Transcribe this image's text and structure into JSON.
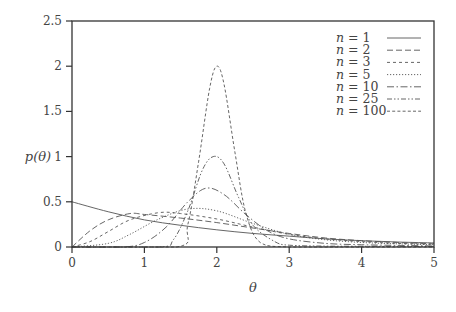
{
  "chart_data": {
    "type": "line",
    "title": "",
    "xlabel": "θ",
    "ylabel": "p(θ)",
    "xlim": [
      0,
      5
    ],
    "ylim": [
      0,
      2.5
    ],
    "x_ticks": [
      "0",
      "1",
      "2",
      "3",
      "4",
      "5"
    ],
    "y_ticks": [
      "0",
      "0.5",
      "1",
      "1.5",
      "2",
      "2.5"
    ],
    "grid": false,
    "legend_position": "upper right",
    "note": "Curve values are approximate visual readings of the plotted densities, not computed from a known formula.",
    "series": [
      {
        "name": "n = 1",
        "style": "solid",
        "peak_theta": 0.0,
        "peak_value": 0.5,
        "x": [
          0,
          0.5,
          1,
          1.5,
          2,
          2.5,
          3,
          3.5,
          4,
          4.5,
          5
        ],
        "y": [
          0.5,
          0.39,
          0.3,
          0.24,
          0.19,
          0.15,
          0.12,
          0.09,
          0.07,
          0.055,
          0.045
        ]
      },
      {
        "name": "n = 2",
        "style": "dashed",
        "peak_theta": 0.8,
        "peak_value": 0.37,
        "x": [
          0,
          0.25,
          0.5,
          0.8,
          1,
          1.5,
          2,
          2.5,
          3,
          3.5,
          4,
          4.5,
          5
        ],
        "y": [
          0,
          0.18,
          0.3,
          0.37,
          0.36,
          0.32,
          0.27,
          0.21,
          0.15,
          0.1,
          0.07,
          0.05,
          0.035
        ]
      },
      {
        "name": "n = 3",
        "style": "short-dashed",
        "peak_theta": 1.2,
        "peak_value": 0.38,
        "x": [
          0,
          0.25,
          0.5,
          0.8,
          1.2,
          1.5,
          2,
          2.5,
          3,
          3.5,
          4,
          4.5,
          5
        ],
        "y": [
          0,
          0.06,
          0.17,
          0.3,
          0.38,
          0.37,
          0.31,
          0.22,
          0.14,
          0.09,
          0.06,
          0.04,
          0.03
        ]
      },
      {
        "name": "n = 5",
        "style": "dotted",
        "peak_theta": 1.6,
        "peak_value": 0.42,
        "x": [
          0,
          0.5,
          0.8,
          1.2,
          1.6,
          2,
          2.5,
          3,
          3.5,
          4,
          4.5,
          5
        ],
        "y": [
          0,
          0.04,
          0.14,
          0.31,
          0.42,
          0.4,
          0.26,
          0.14,
          0.08,
          0.05,
          0.035,
          0.025
        ]
      },
      {
        "name": "n = 10",
        "style": "dash-dot",
        "peak_theta": 1.85,
        "peak_value": 0.65,
        "x": [
          0,
          0.7,
          1,
          1.3,
          1.6,
          1.85,
          2.1,
          2.4,
          2.7,
          3,
          3.5,
          4,
          4.5,
          5
        ],
        "y": [
          0,
          0.0,
          0.05,
          0.22,
          0.5,
          0.65,
          0.58,
          0.36,
          0.18,
          0.09,
          0.04,
          0.025,
          0.018,
          0.012
        ]
      },
      {
        "name": "n = 25",
        "style": "dash-dot-dot",
        "peak_theta": 1.95,
        "peak_value": 1.0,
        "x": [
          0,
          1.2,
          1.4,
          1.6,
          1.8,
          1.95,
          2.1,
          2.3,
          2.5,
          2.8,
          3,
          3.5,
          4,
          5
        ],
        "y": [
          0,
          0.0,
          0.08,
          0.4,
          0.85,
          1.0,
          0.92,
          0.55,
          0.24,
          0.06,
          0.02,
          0.01,
          0.008,
          0.005
        ]
      },
      {
        "name": "n = 100",
        "style": "fine-dashed",
        "peak_theta": 2.0,
        "peak_value": 2.0,
        "x": [
          0,
          1.45,
          1.6,
          1.75,
          1.9,
          2.0,
          2.1,
          2.25,
          2.4,
          2.6,
          3,
          4,
          5
        ],
        "y": [
          0,
          0.0,
          0.25,
          0.95,
          1.75,
          2.0,
          1.8,
          1.05,
          0.38,
          0.05,
          0.0,
          0.0,
          0.0
        ]
      }
    ]
  },
  "legend": {
    "items": [
      {
        "label": "n = 1"
      },
      {
        "label": "n = 2"
      },
      {
        "label": "n = 3"
      },
      {
        "label": "n = 5"
      },
      {
        "label": "n = 10"
      },
      {
        "label": "n = 25"
      },
      {
        "label": "n = 100"
      }
    ]
  },
  "axes": {
    "xlabel": "θ",
    "ylabel": "p(θ)",
    "x_ticks": [
      "0",
      "1",
      "2",
      "3",
      "4",
      "5"
    ],
    "y_ticks": [
      "0",
      "0.5",
      "1",
      "1.5",
      "2",
      "2.5"
    ]
  }
}
